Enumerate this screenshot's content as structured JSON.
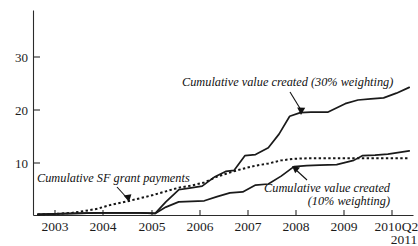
{
  "chart_data": {
    "type": "line",
    "title": "",
    "subtitle": "",
    "xlabel": "",
    "ylabel": "",
    "grid": false,
    "legend_position": "inline-annotations",
    "xlim": [
      2002.5,
      2011.4
    ],
    "ylim": [
      0,
      36
    ],
    "y_ticks": [
      10,
      20,
      30
    ],
    "y_tick_labels": [
      "10",
      "20",
      "30"
    ],
    "x_ticks": [
      2003,
      2004,
      2005,
      2006,
      2007,
      2008,
      2009,
      2010
    ],
    "x_tick_labels": [
      "2003",
      "2004",
      "2005",
      "2006",
      "2007",
      "2008",
      "2009",
      "2010"
    ],
    "x_end_label_line1": "Q2",
    "x_end_label_line2": "2011",
    "x_end_label": "Q2 2011",
    "series": [
      {
        "name": "Cumulative value created (30% weighting)",
        "style": "solid",
        "x": [
          2002.6,
          2003.0,
          2003.5,
          2004.0,
          2004.5,
          2005.0,
          2005.35,
          2005.6,
          2005.9,
          2006.15,
          2006.45,
          2006.75,
          2007.0,
          2007.2,
          2007.45,
          2007.7,
          2008.0,
          2008.25,
          2008.5,
          2008.75,
          2009.0,
          2009.4,
          2009.8,
          2010.1,
          2010.4,
          2010.7,
          2011.0,
          2011.3
        ],
        "values": [
          0.2,
          0.3,
          0.4,
          0.5,
          0.5,
          0.5,
          0.4,
          2.6,
          4.9,
          5.2,
          5.6,
          7.4,
          8.4,
          8.6,
          11.4,
          11.6,
          12.9,
          15.5,
          18.9,
          19.6,
          19.7,
          19.7,
          21.3,
          22.0,
          22.2,
          22.4,
          23.3,
          24.4
        ]
      },
      {
        "name": "Cumulative SF grant payments",
        "style": "dotted",
        "x": [
          2002.6,
          2003.0,
          2003.4,
          2003.8,
          2004.0,
          2004.3,
          2004.7,
          2005.0,
          2005.3,
          2005.6,
          2005.9,
          2006.2,
          2006.5,
          2006.8,
          2007.1,
          2007.4,
          2007.7,
          2008.0,
          2008.3,
          2008.6,
          2008.9,
          2009.3,
          2009.8,
          2010.3,
          2010.8,
          2011.3
        ],
        "values": [
          0.2,
          0.3,
          0.5,
          1.0,
          1.3,
          2.0,
          2.7,
          3.3,
          3.9,
          4.6,
          5.3,
          5.7,
          6.3,
          7.4,
          8.2,
          8.9,
          9.5,
          9.9,
          10.5,
          10.8,
          10.9,
          10.9,
          10.9,
          10.9,
          10.9,
          10.9
        ]
      },
      {
        "name": "Cumulative value created (10% weighting)",
        "style": "solid",
        "x": [
          2002.6,
          2003.0,
          2003.5,
          2004.0,
          2004.5,
          2005.0,
          2005.35,
          2005.6,
          2005.9,
          2006.2,
          2006.5,
          2006.8,
          2007.1,
          2007.4,
          2007.7,
          2008.0,
          2008.3,
          2008.6,
          2008.9,
          2009.2,
          2009.6,
          2010.0,
          2010.2,
          2010.5,
          2010.8,
          2011.3
        ],
        "values": [
          0.2,
          0.3,
          0.4,
          0.5,
          0.5,
          0.5,
          0.4,
          1.6,
          2.6,
          2.7,
          2.8,
          3.6,
          4.3,
          4.5,
          5.8,
          6.0,
          7.5,
          9.3,
          9.5,
          9.6,
          9.7,
          10.5,
          11.4,
          11.5,
          11.7,
          12.3
        ]
      }
    ],
    "annotations": [
      {
        "id": "annot-30pct",
        "text": "Cumulative value created (30% weighting)",
        "lines": [
          "Cumulative value created (30% weighting)"
        ],
        "points_to_series": "Cumulative value created (30% weighting)"
      },
      {
        "id": "annot-sf-grant",
        "text": "Cumulative SF grant payments",
        "lines": [
          "Cumulative SF grant payments"
        ],
        "points_to_series": "Cumulative SF grant payments"
      },
      {
        "id": "annot-10pct",
        "text": "Cumulative value created (10% weighting)",
        "lines": [
          "Cumulative value created",
          "(10% weighting)"
        ],
        "points_to_series": "Cumulative value created (10% weighting)"
      }
    ],
    "colors": {
      "line": "#1a1a1a",
      "axis": "#2b2b2b",
      "text": "#111111",
      "background": "#ffffff"
    }
  }
}
